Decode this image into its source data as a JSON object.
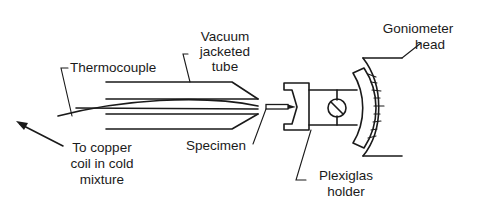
{
  "diagram": {
    "type": "apparatus schematic",
    "labels": {
      "vacuum_tube": [
        "Vacuum",
        "jacketed",
        "tube"
      ],
      "thermocouple": "Thermocouple",
      "goniometer": [
        "Goniometer",
        "head"
      ],
      "copper_coil": [
        "To copper",
        "coil in cold",
        "mixture"
      ],
      "specimen": "Specimen",
      "plexiglas": [
        "Plexiglas",
        "holder"
      ]
    },
    "components": [
      "thermocouple",
      "vacuum-jacketed-tube",
      "specimen",
      "plexiglas-holder",
      "goniometer-head"
    ],
    "colors": {
      "ink": "#1a1a1a",
      "background": "#ffffff"
    }
  }
}
